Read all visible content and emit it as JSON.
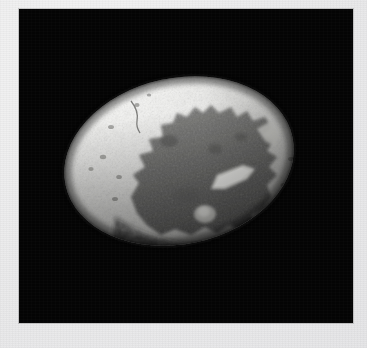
{
  "page": {
    "kind": "scanned-photograph",
    "width": 367,
    "height": 348,
    "background_color": "#ececed"
  },
  "plate": {
    "name": "photographic-plate",
    "background_color": "#050505",
    "left": 19,
    "top": 9,
    "width": 334,
    "height": 314
  },
  "specimen": {
    "description": "ovoid egg-shaped specimen photographed against a black background",
    "shape": "ellipsoid",
    "center_x": 179,
    "center_y": 161,
    "radius_x": 116,
    "radius_y": 83,
    "rotation_deg": -12,
    "bounds": {
      "left": 63,
      "top": 78,
      "right": 295,
      "bottom": 243
    },
    "regions": [
      {
        "name": "bright-speckled-shell",
        "label": "bright speckled outer shell surface",
        "color": "#e2e2e0",
        "highlight_color": "#f6f6f4",
        "speckle_color": "#8e8e8c"
      },
      {
        "name": "dark-interior-patch",
        "label": "large dark gray broken interior patch",
        "color": "#6e6e6c",
        "shadow_color": "#4a4a49"
      },
      {
        "name": "bright-wedge-sliver",
        "label": "bright angular wedge highlight on lower right of dark patch",
        "color": "#f2f2ee"
      },
      {
        "name": "lower-rim-shadow",
        "label": "dark shadowed lower rim",
        "color": "#3a3a39"
      }
    ]
  },
  "colors": {
    "paper": "#ececed",
    "plate_black": "#050505",
    "shell_light": "#e8e8e6",
    "shell_highlight": "#fafaf8",
    "interior_gray": "#6f6f6d",
    "rim_shadow": "#2e2e2d"
  }
}
